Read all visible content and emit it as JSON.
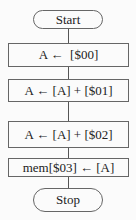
{
  "flowchart": {
    "start": "Start",
    "steps": [
      "A ←  [$00]",
      "A ← [A] + [$01]",
      "A ← [A] + [$02]",
      "mem[$03] ← [A]"
    ],
    "stop": "Stop"
  }
}
